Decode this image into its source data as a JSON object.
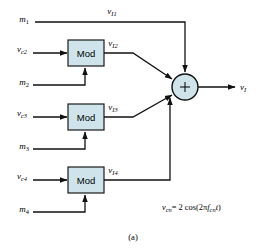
{
  "figure": {
    "caption": "(a)",
    "equation": {
      "lhs_var": "v",
      "lhs_sub": "cn",
      "eq": "= 2 cos(2",
      "pi": "π",
      "f_var": "f",
      "f_sub": "cn",
      "t_var": "t",
      "close": ")",
      "full_text": "v_cn = 2 cos(2π f_cn t)"
    },
    "colors": {
      "box_fill": "#cfe4ea",
      "line": "#111111",
      "background": "#ffffff"
    }
  },
  "blocks": [
    {
      "id": "mod2",
      "label": "Mod"
    },
    {
      "id": "mod3",
      "label": "Mod"
    },
    {
      "id": "mod4",
      "label": "Mod"
    }
  ],
  "summing_junction": {
    "name": "summing-junction",
    "symbol": "+"
  },
  "signals": {
    "m1": {
      "var": "m",
      "sub": "1"
    },
    "m2": {
      "var": "m",
      "sub": "2"
    },
    "m3": {
      "var": "m",
      "sub": "3"
    },
    "m4": {
      "var": "m",
      "sub": "4"
    },
    "vc2": {
      "var": "v",
      "sub": "c2"
    },
    "vc3": {
      "var": "v",
      "sub": "c3"
    },
    "vc4": {
      "var": "v",
      "sub": "c4"
    },
    "vI1": {
      "var": "v",
      "sub": "I1"
    },
    "vI2": {
      "var": "v",
      "sub": "I2"
    },
    "vI3": {
      "var": "v",
      "sub": "I3"
    },
    "vI4": {
      "var": "v",
      "sub": "I4"
    },
    "vI_out": {
      "var": "v",
      "sub": "I"
    }
  }
}
